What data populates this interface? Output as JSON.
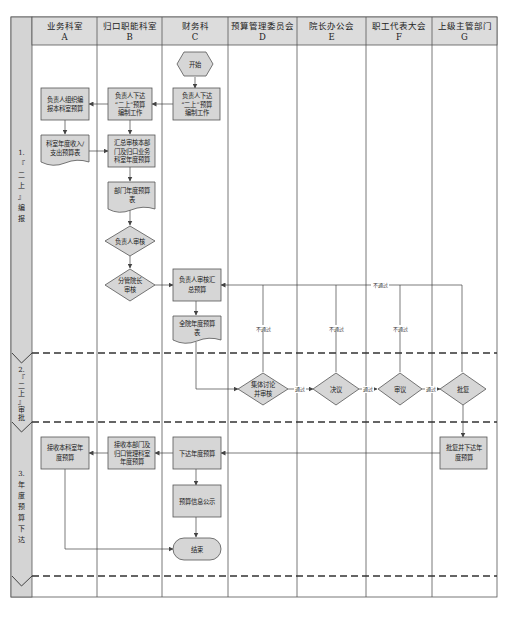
{
  "lanes": [
    {
      "name": "业务科室",
      "letter": "A"
    },
    {
      "name": "归口职能科室",
      "letter": "B"
    },
    {
      "name": "财务科",
      "letter": "C"
    },
    {
      "name": "预算管理委员会",
      "letter": "D"
    },
    {
      "name": "院长办公会",
      "letter": "E"
    },
    {
      "name": "职工代表大会",
      "letter": "F"
    },
    {
      "name": "上级主管部门",
      "letter": "G"
    }
  ],
  "phases": [
    {
      "chars": [
        "1.",
        "『",
        "二",
        "上",
        "』",
        "编",
        "报"
      ]
    },
    {
      "chars": [
        "2.",
        "『",
        "二",
        "上",
        "』",
        "审",
        "批"
      ]
    },
    {
      "chars": [
        "3.",
        "年",
        "度",
        "预",
        "算",
        "下",
        "达"
      ]
    }
  ],
  "nodes": {
    "start": "开始",
    "c1": [
      "负责人下达",
      "“二上”预算",
      "编制工作"
    ],
    "b1": [
      "负责人下达",
      "“二上”预算",
      "编制工作"
    ],
    "a1": [
      "负责人组织编",
      "报本科室预算"
    ],
    "a2": [
      "科室年度收入/",
      "支出预算表"
    ],
    "b2": [
      "汇总审核本部",
      "门及归口业务",
      "科室年度预算"
    ],
    "b3": [
      "部门年度预算",
      "表"
    ],
    "b4": [
      "负责人审核"
    ],
    "b5": [
      "分管院长",
      "审核"
    ],
    "c2": [
      "负责人审核汇",
      "总预算"
    ],
    "c3": [
      "全院年度预算",
      "表"
    ],
    "d1": [
      "集体讨论",
      "并审核"
    ],
    "e1": [
      "决议"
    ],
    "f1": [
      "审议"
    ],
    "g1": [
      "批复"
    ],
    "g2": [
      "批复并下达年",
      "度预算"
    ],
    "c4": [
      "下达年度预算"
    ],
    "b6": [
      "接收本部门及",
      "归口管理科室",
      "年度预算"
    ],
    "a3": [
      "接收本科室年",
      "度预算"
    ],
    "c5": [
      "预算信息公示"
    ],
    "end": "结束"
  },
  "edge_labels": {
    "reject": "不通过",
    "pass": "通过"
  },
  "colors": {
    "box_fill": "#d6d6d6",
    "header_fill": "#dcdcdc",
    "sidebar_fill": "#d4d4d4",
    "line": "#444444"
  }
}
